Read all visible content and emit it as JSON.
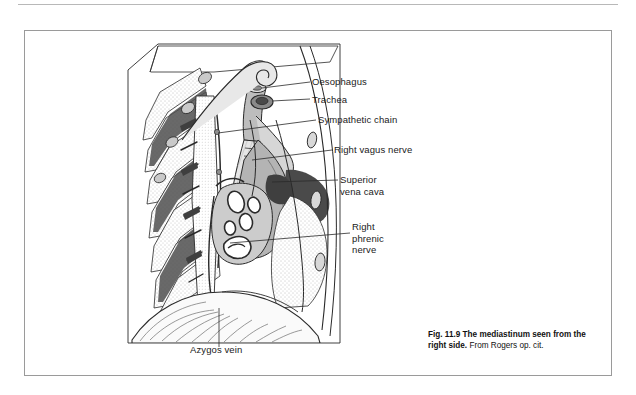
{
  "figure": {
    "title": "The mediastinum seen from the right side",
    "number": "Fig. 11.9",
    "source": "From Rogers op. cit.",
    "caption_bold": "Fig. 11.9   The mediastinum seen from the right side.",
    "caption_source": " From Rogers op. cit."
  },
  "labels": [
    {
      "id": "oesophagus",
      "text": "Oesophagus",
      "x": 312,
      "y": 82
    },
    {
      "id": "trachea",
      "text": "Trachea",
      "x": 312,
      "y": 101
    },
    {
      "id": "sympathetic-chain",
      "text": "Sympathetic chain",
      "x": 318,
      "y": 120
    },
    {
      "id": "right-vagus-nerve",
      "text": "Right vagus nerve",
      "x": 334,
      "y": 150
    },
    {
      "id": "superior-vena-cava",
      "text": "Superior\nvena cava",
      "x": 340,
      "y": 178
    },
    {
      "id": "right-phrenic-nerve",
      "text": "Right\nphrenic\nnerve",
      "x": 352,
      "y": 225
    },
    {
      "id": "azygos-vein",
      "text": "Azygos vein",
      "x": 190,
      "y": 350
    }
  ],
  "colors": {
    "ink": "#1a1a1a",
    "line": "#222222",
    "dark_tissue": "#4a4a4a",
    "mid_tissue": "#9a9a9a",
    "light_tissue": "#d4d4d4",
    "pale_tissue": "#ececec",
    "page_border": "#9a9a9a",
    "background": "#ffffff"
  },
  "anatomy": {
    "structures": [
      "thoracic inlet cut plane",
      "rib cage with intercostal spaces",
      "vertebral column",
      "trachea with cartilage rings",
      "oesophagus",
      "subclavian vessels arch",
      "superior vena cava",
      "azygos vein arch",
      "right main bronchus and pulmonary vessels at hilum",
      "diaphragm dome",
      "sympathetic chain",
      "right vagus nerve",
      "right phrenic nerve"
    ]
  }
}
